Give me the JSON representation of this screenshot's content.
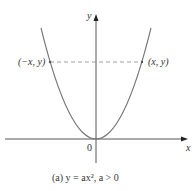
{
  "figure": {
    "axis_x_label": "x",
    "axis_y_label": "y",
    "origin_label": "0",
    "point_left_label": "(−x, y)",
    "point_right_label": "(x, y)",
    "caption": "(a)  y = ax², a > 0"
  },
  "colors": {
    "curve": "#777777",
    "axis": "#444444",
    "dashed": "#888888"
  }
}
